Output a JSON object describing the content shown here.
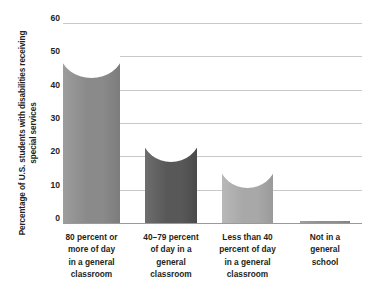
{
  "chart_data": {
    "type": "bar",
    "title": "",
    "subtitle": "",
    "xlabel": "",
    "ylabel": "Percentage of U.S. students with disabilities receiving special services",
    "ylim": [
      0,
      60
    ],
    "yticks": [
      0,
      10,
      20,
      30,
      40,
      50,
      60
    ],
    "ytick_labels": [
      "0",
      "10",
      "20",
      "30",
      "40",
      "50",
      "60"
    ],
    "grid": true,
    "legend": false,
    "legend_position": "none",
    "categories": [
      "80 percent or more of day in a general classroom",
      "40–79 percent of day in a general classroom",
      "Less than 40 percent of day in a general classroom",
      "Not in a general school"
    ],
    "category_lines": [
      [
        "80 percent or",
        "more of day",
        "in a general",
        "classroom"
      ],
      [
        "40–79 percent",
        "of day in a",
        "general",
        "classroom"
      ],
      [
        "Less than 40",
        "percent of day",
        "in a general",
        "classroom"
      ],
      [
        "Not in a",
        "general",
        "school"
      ]
    ],
    "values": [
      50,
      25,
      17,
      3
    ],
    "bar_colors": [
      "#8a8a8a",
      "#585858",
      "#a8a8a8",
      "#8f8f8f"
    ],
    "bar_colors_light": [
      "#9d9d9d",
      "#6e6e6e",
      "#b8b8b8",
      "#a0a0a0"
    ],
    "bar_left_px": [
      0,
      82,
      159,
      237
    ],
    "bar_width_px": [
      57,
      52,
      51,
      50
    ],
    "grid_color": "#c9c9c9",
    "axis_color": "#9a9a9a",
    "text_color": "#231f20",
    "background": "#ffffff"
  }
}
